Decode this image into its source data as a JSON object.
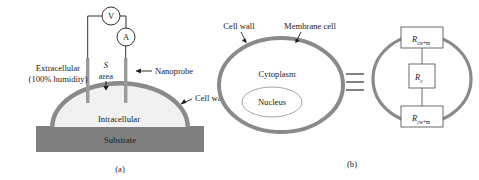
{
  "figure": {
    "panel_a": {
      "caption": "(a)",
      "meters": [
        {
          "name": "voltmeter",
          "symbol": "V"
        },
        {
          "name": "ammeter",
          "symbol": "A"
        }
      ],
      "labels": {
        "extracellular_line1": "Extracellular",
        "extracellular_line2": "(100% humidity)",
        "area_symbol": "S",
        "area_word": "area",
        "nanoprobe": "Nanoprobe",
        "cell_wall": "Cell wall",
        "intracellular": "Intracellular",
        "substrate": "Substrate"
      }
    },
    "panel_b": {
      "caption": "(b)",
      "labels": {
        "cell_wall": "Cell wall",
        "membrane_cell": "Membrane cell",
        "cytoplasm": "Cytoplasm",
        "nucleus": "Nucleus"
      },
      "equivalence_symbol": "≡",
      "circuit": {
        "resistors": [
          {
            "position": "top",
            "symbol": "R",
            "subscript": "cw+m"
          },
          {
            "position": "middle",
            "symbol": "R",
            "subscript": "c"
          },
          {
            "position": "bottom",
            "symbol": "R",
            "subscript": "cw+m"
          }
        ]
      }
    },
    "colors": {
      "cell_wall_gray": "#8a8a8a",
      "substrate_gray": "#7f7f7f",
      "intracellular_fill": "#f1f1f1",
      "probe_gray": "#9a9a9a",
      "line_black": "#1a1a1a",
      "background": "#ffffff"
    }
  }
}
